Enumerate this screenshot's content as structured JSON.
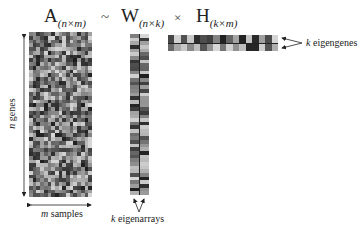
{
  "equation": {
    "A": {
      "symbol": "A",
      "subscript": "(n×m)"
    },
    "approx": "~",
    "W": {
      "symbol": "W",
      "subscript": "(n×k)"
    },
    "times": "×",
    "H": {
      "symbol": "H",
      "subscript": "(k×m)"
    }
  },
  "labels": {
    "genes": {
      "var": "n",
      "text": " genes"
    },
    "samples": {
      "var": "m",
      "text": " samples"
    },
    "eigenarrays": {
      "var": "k",
      "text": " eigenarrays"
    },
    "eigengenes": {
      "var": "k",
      "text": " eigengenes"
    }
  },
  "matrices": {
    "A": {
      "rows": 44,
      "cols": 17
    },
    "W": {
      "rows": 44,
      "cols": 2
    },
    "H": {
      "rows": 2,
      "cols": 17
    }
  },
  "colors": {
    "cell_min": "#1e1e1e",
    "cell_max": "#d8d8d8",
    "arrow": "#222222"
  }
}
